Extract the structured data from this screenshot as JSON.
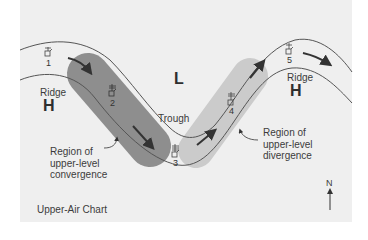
{
  "title": "Upper-Air Chart",
  "colors": {
    "background": "#efefef",
    "convergence_band": "#8e8e8e",
    "divergence_band": "#c9c9c9",
    "contour_line": "#555555",
    "arrow": "#333333"
  },
  "pressure_centers": {
    "left_ridge": {
      "label": "Ridge",
      "symbol": "H"
    },
    "low": {
      "symbol": "L"
    },
    "right_ridge": {
      "label": "Ridge",
      "symbol": "H"
    }
  },
  "trough_label": "Trough",
  "stations": [
    {
      "id": "1"
    },
    {
      "id": "2"
    },
    {
      "id": "3"
    },
    {
      "id": "4"
    },
    {
      "id": "5"
    }
  ],
  "annotations": {
    "convergence": [
      "Region of",
      "upper-level",
      "convergence"
    ],
    "divergence": [
      "Region of",
      "upper-level",
      "divergence"
    ]
  },
  "compass": {
    "label": "N"
  }
}
